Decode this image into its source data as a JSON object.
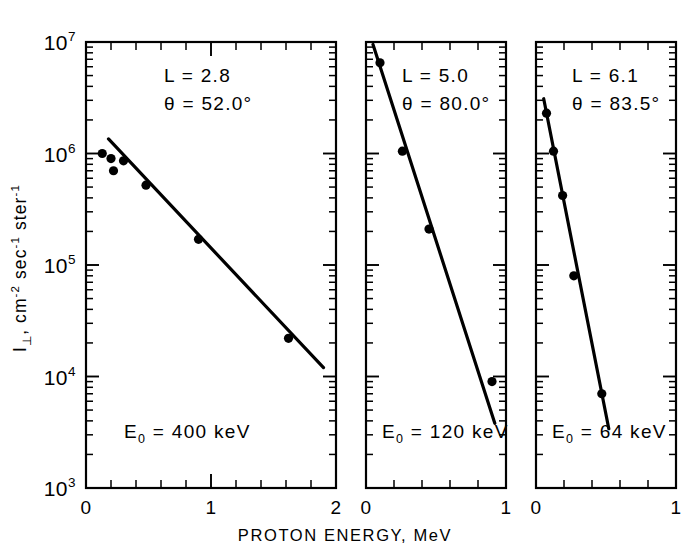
{
  "figure": {
    "background_color": "#ffffff",
    "ink_color": "#000000",
    "y_axis_label_parts": {
      "symbol": "I",
      "subscript": "⊥",
      "comma": ", ",
      "units_cm": "cm",
      "units_cm_exp": "-2",
      "units_sec": " sec",
      "units_sec_exp": "-1",
      "units_ster": " ster",
      "units_ster_exp": "-1",
      "full": "I⊥, cm-2 sec-1 ster-1"
    },
    "x_axis_label": "PROTON ENERGY, MeV",
    "y_tick_labels": [
      "10 7",
      "10 6",
      "10 5",
      "10 4",
      "10 3"
    ],
    "y_tick_bases": [
      "10",
      "10",
      "10",
      "10",
      "10"
    ],
    "y_tick_exponents": [
      "7",
      "6",
      "5",
      "4",
      "3"
    ]
  },
  "chart_data": {
    "type": "scatter",
    "title": "",
    "xlabel": "PROTON ENERGY, MeV",
    "ylabel": "I⊥, cm-2 sec-1 ster-1",
    "yscale": "log",
    "xscale": "linear",
    "ylim": [
      1000,
      10000000
    ],
    "ydecades": [
      3,
      4,
      5,
      6,
      7
    ],
    "grid": false,
    "legend": "none",
    "panels": [
      {
        "index": 1,
        "xlim": [
          0,
          2
        ],
        "xticks": [
          0,
          1,
          2
        ],
        "xtick_labels": [
          "0",
          "1",
          "2"
        ],
        "annotations": {
          "L_label": "L  =  2.8",
          "theta_label": "θ  =  52.0°",
          "L_value": "2.8",
          "theta_value": "52.0",
          "E0_prefix": "E",
          "E0_subscript": "0",
          "E0_label": "=  400 keV",
          "E0_value": "400 keV"
        },
        "points": [
          {
            "x": 0.13,
            "y": 1000000
          },
          {
            "x": 0.2,
            "y": 900000
          },
          {
            "x": 0.22,
            "y": 700000
          },
          {
            "x": 0.3,
            "y": 860000
          },
          {
            "x": 0.48,
            "y": 520000
          },
          {
            "x": 0.9,
            "y": 170000
          },
          {
            "x": 1.62,
            "y": 22000
          }
        ],
        "fit_line": {
          "x1": 0.18,
          "y1": 1350000,
          "x2": 1.9,
          "y2": 12000
        }
      },
      {
        "index": 2,
        "xlim": [
          0,
          1
        ],
        "xticks": [
          0,
          1
        ],
        "xtick_labels": [
          "0",
          "1"
        ],
        "annotations": {
          "L_label": "L  =  5.0",
          "theta_label": "θ  =  80.0°",
          "L_value": "5.0",
          "theta_value": "80.0",
          "E0_prefix": "E",
          "E0_subscript": "0",
          "E0_label": "=  120 keV",
          "E0_value": "120 keV"
        },
        "points": [
          {
            "x": 0.1,
            "y": 6500000
          },
          {
            "x": 0.26,
            "y": 1050000
          },
          {
            "x": 0.45,
            "y": 210000
          },
          {
            "x": 0.9,
            "y": 9000
          }
        ],
        "fit_line": {
          "x1": 0.05,
          "y1": 9500000,
          "x2": 0.92,
          "y2": 3800
        }
      },
      {
        "index": 3,
        "xlim": [
          0,
          1
        ],
        "xticks": [
          0,
          1
        ],
        "xtick_labels": [
          "0",
          "1"
        ],
        "annotations": {
          "L_label": "L  =  6.1",
          "theta_label": "θ  =  83.5°",
          "L_value": "6.1",
          "theta_value": "83.5",
          "E0_prefix": "E",
          "E0_subscript": "0",
          "E0_label": "=  64 keV",
          "E0_value": "64 keV"
        },
        "points": [
          {
            "x": 0.075,
            "y": 2300000
          },
          {
            "x": 0.125,
            "y": 1050000
          },
          {
            "x": 0.19,
            "y": 420000
          },
          {
            "x": 0.27,
            "y": 80000
          },
          {
            "x": 0.47,
            "y": 7000
          }
        ],
        "fit_line": {
          "x1": 0.055,
          "y1": 3100000,
          "x2": 0.52,
          "y2": 3400
        }
      }
    ]
  }
}
